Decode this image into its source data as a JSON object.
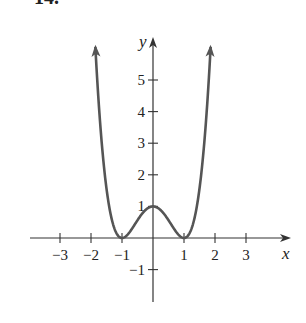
{
  "problem": {
    "label": "14."
  },
  "chart_data": {
    "type": "line",
    "title": "",
    "function": "y = (x^2 - 1)^2",
    "xlabel": "x",
    "ylabel": "y",
    "xlim": [
      -4,
      4.3
    ],
    "ylim": [
      -2,
      6.2
    ],
    "grid": false,
    "legend": null,
    "x_ticks": [
      -3,
      -2,
      -1,
      1,
      2,
      3
    ],
    "x_tick_labels": [
      "−3",
      "−2",
      "−1",
      "1",
      "2",
      "3"
    ],
    "y_ticks": [
      -1,
      1,
      2,
      3,
      4,
      5
    ],
    "y_tick_labels": [
      "−1",
      "1",
      "2",
      "3",
      "4",
      "5"
    ],
    "series": [
      {
        "name": "curve",
        "color": "#555555",
        "x": [
          -1.86,
          -1.75,
          -1.5,
          -1.25,
          -1.0,
          -0.75,
          -0.5,
          -0.25,
          0.0,
          0.25,
          0.5,
          0.75,
          1.0,
          1.25,
          1.5,
          1.75,
          1.86
        ],
        "y": [
          6.1,
          4.25,
          1.56,
          0.32,
          0.0,
          0.19,
          0.56,
          0.88,
          1.0,
          0.88,
          0.56,
          0.19,
          0.0,
          0.32,
          1.56,
          4.25,
          6.1
        ],
        "arrows": [
          "both-ends-up"
        ]
      }
    ],
    "key_points": [
      {
        "x": 0,
        "y": 1,
        "note": "local maximum"
      },
      {
        "x": -1,
        "y": 0,
        "note": "minimum"
      },
      {
        "x": 1,
        "y": 0,
        "note": "minimum"
      }
    ]
  },
  "colors": {
    "axis": "#333333",
    "curve": "#555555",
    "text": "#222222"
  }
}
